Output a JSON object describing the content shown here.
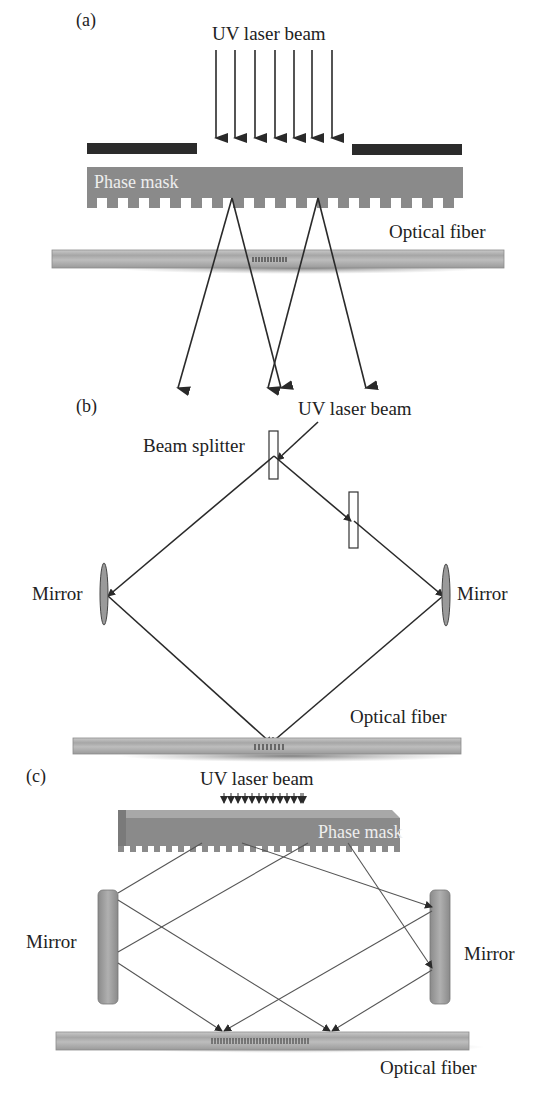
{
  "figure": {
    "panels": [
      {
        "id": "a",
        "label": "(a)",
        "title": "Phase mask technique",
        "components": {
          "source": "UV laser beam",
          "mask": "Phase mask",
          "fiber": "Optical fiber"
        },
        "incident_arrow_count": 7,
        "diffracted_ray_count": 4
      },
      {
        "id": "b",
        "label": "(b)",
        "title": "Interferometric technique",
        "components": {
          "source": "UV laser beam",
          "splitter": "Beam splitter",
          "mirror_left": "Mirror",
          "mirror_right": "Mirror",
          "fiber": "Optical fiber"
        }
      },
      {
        "id": "c",
        "label": "(c)",
        "title": "Phase mask interferometer",
        "components": {
          "source": "UV laser beam",
          "mask": "Phase mask",
          "mirror_left": "Mirror",
          "mirror_right": "Mirror",
          "fiber": "Optical fiber"
        },
        "incident_arrow_count": 13
      }
    ]
  },
  "colors": {
    "mask": "#8a8a8a",
    "mask_dark": "#6e6e6e",
    "block": "#2b2b2b",
    "fiber": "#b5b5b5",
    "fiber_core": "#999999",
    "mirror": "#9a9a9a",
    "line": "#2a2a2a"
  }
}
